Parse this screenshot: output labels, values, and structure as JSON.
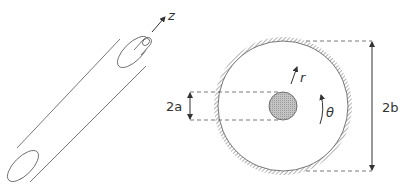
{
  "diagram": {
    "cylinder": {
      "axis_label": "z"
    },
    "cross_section": {
      "inner_label": "2a",
      "outer_label": "2b",
      "radial_label": "r",
      "angular_label": "θ"
    }
  },
  "colors": {
    "stroke": "#444444",
    "inner_fill": "#b0b0b0",
    "hatch": "#666666"
  }
}
